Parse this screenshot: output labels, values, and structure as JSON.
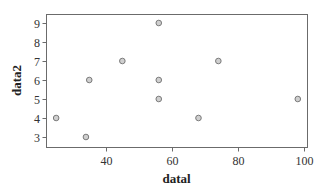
{
  "chart_data": {
    "type": "scatter",
    "title": "",
    "xlabel": "datal",
    "ylabel": "data2",
    "xlim": [
      22,
      100
    ],
    "ylim": [
      2.5,
      9.5
    ],
    "xticks": [
      40,
      60,
      80,
      100
    ],
    "yticks": [
      3,
      4,
      5,
      6,
      7,
      8,
      9
    ],
    "grid": false,
    "legend": null,
    "series": [
      {
        "name": "data",
        "marker_fill": "#cfcfcf",
        "marker_edge": "#7a7a7a",
        "points": [
          {
            "x": 25,
            "y": 4
          },
          {
            "x": 34,
            "y": 3
          },
          {
            "x": 35,
            "y": 6
          },
          {
            "x": 45,
            "y": 7
          },
          {
            "x": 56,
            "y": 9
          },
          {
            "x": 56,
            "y": 6
          },
          {
            "x": 56,
            "y": 5
          },
          {
            "x": 68,
            "y": 4
          },
          {
            "x": 74,
            "y": 7
          },
          {
            "x": 98,
            "y": 5
          }
        ]
      }
    ]
  },
  "layout": {
    "frame": {
      "left": 46,
      "top": 14,
      "right": 307,
      "bottom": 147
    },
    "x_map": {
      "origin_px": -26.6,
      "px_per_unit": 3.31
    },
    "y_map": {
      "ref_value": 9,
      "ref_px": 23,
      "px_per_unit": 19
    }
  }
}
